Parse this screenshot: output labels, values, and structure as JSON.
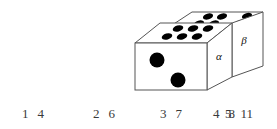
{
  "figure": {
    "type": "domino-cuboid-3d",
    "stroke_color": "#555555",
    "pip_color": "#000000",
    "background": "#ffffff",
    "faces": {
      "front_left": {
        "name": "front-face-two-pips",
        "pip_count": 2,
        "pips": [
          {
            "cx": 22,
            "cy": 20,
            "r": 7.5
          },
          {
            "cx": 41,
            "cy": 42,
            "r": 7.5
          }
        ]
      },
      "top_near": {
        "name": "top-face-six-pips",
        "pip_count": 6,
        "label": ""
      },
      "top_far": {
        "name": "top-face-far-five-pips",
        "pip_count": 5,
        "label": ""
      },
      "side_alpha": {
        "name": "side-face-alpha",
        "label": "α"
      },
      "side_beta": {
        "name": "side-face-beta",
        "label": "β"
      }
    }
  },
  "answers": {
    "options": [
      {
        "key": "1",
        "value": "4"
      },
      {
        "key": "2",
        "value": "6"
      },
      {
        "key": "3",
        "value": "7"
      },
      {
        "key": "4",
        "value": "8"
      },
      {
        "key": "5",
        "value": "11"
      }
    ]
  }
}
